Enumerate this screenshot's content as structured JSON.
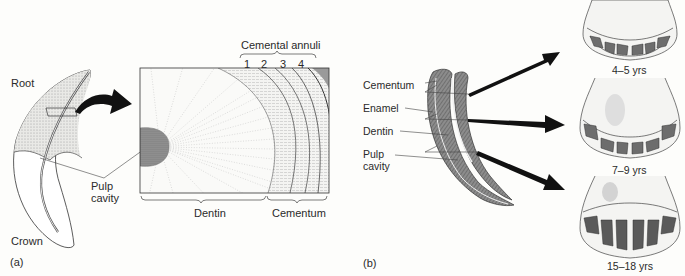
{
  "panel_a": {
    "label": "(a)",
    "tooth_labels": {
      "root": "Root",
      "crown": "Crown",
      "pulp_line1": "Pulp",
      "pulp_line2": "cavity"
    },
    "cross_section": {
      "top_label": "Cemental annuli",
      "annuli": [
        "1",
        "2",
        "3",
        "4"
      ],
      "bottom_labels": {
        "dentin": "Dentin",
        "cementum": "Cementum"
      }
    }
  },
  "panel_b": {
    "label": "(b)",
    "tooth_labels": {
      "cementum": "Cementum",
      "enamel": "Enamel",
      "dentin": "Dentin",
      "pulp_line1": "Pulp",
      "pulp_line2": "cavity"
    },
    "jaw_ages": [
      "4–5 yrs",
      "7–9 yrs",
      "15–18 yrs"
    ]
  },
  "colors": {
    "ink": "#222222",
    "stipple": "#c8c8c8",
    "pulp": "#8a8a8a",
    "background": "#fdfdfb"
  }
}
